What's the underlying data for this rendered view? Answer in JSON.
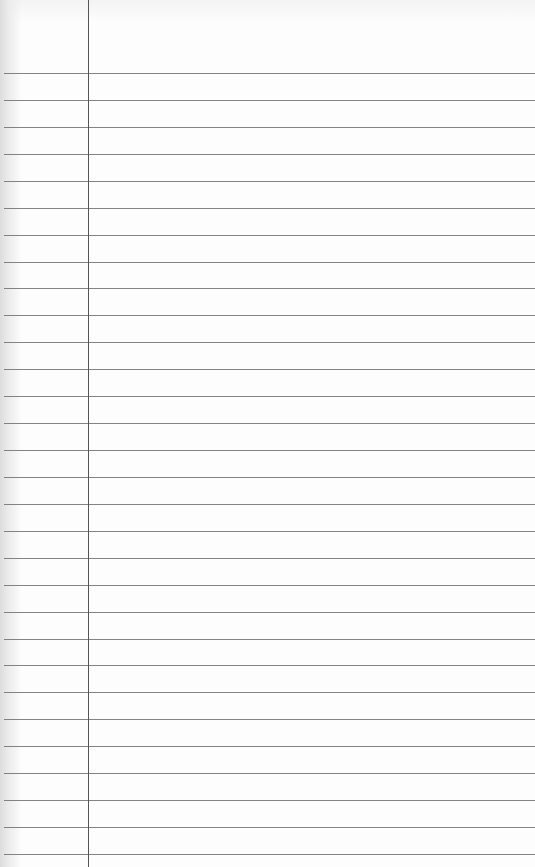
{
  "page": {
    "type": "lined-paper",
    "background_color": "#fdfdfd",
    "rule_color": "#6e6e6e",
    "margin_color": "#555555",
    "margin_x": 88,
    "first_rule_y": 73,
    "rule_spacing": 26.93,
    "rule_count": 30,
    "text": ""
  }
}
